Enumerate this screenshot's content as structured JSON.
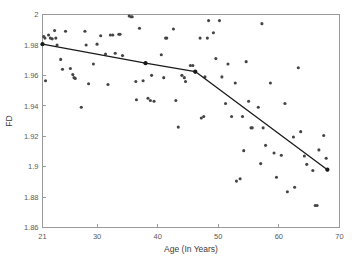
{
  "chart_data": {
    "type": "scatter",
    "title": "",
    "xlabel": "Age (In Years)",
    "ylabel": "FD",
    "xlim": [
      21,
      70
    ],
    "ylim": [
      1.86,
      2.0
    ],
    "grid": false,
    "legend": null,
    "xticks": [
      21,
      30,
      40,
      50,
      60,
      70
    ],
    "xticklabels": [
      "21",
      "30",
      "40",
      "50",
      "60",
      "70"
    ],
    "yticks": [
      1.86,
      1.88,
      1.9,
      1.92,
      1.94,
      1.96,
      1.98,
      2
    ],
    "yticklabels": [
      "1.86",
      "1.88",
      "1.9",
      "1.92",
      "1.94",
      "1.96",
      "1.98",
      "2"
    ],
    "series": [
      {
        "name": "FD measurements",
        "type": "scatter",
        "marker": "dot",
        "color": "#444444",
        "points": [
          [
            21.2,
            1.9855
          ],
          [
            21.4,
            1.9845
          ],
          [
            21.5,
            1.9565
          ],
          [
            22.0,
            1.9865
          ],
          [
            22.3,
            1.9845
          ],
          [
            22.6,
            1.984
          ],
          [
            23.0,
            1.9895
          ],
          [
            23.2,
            1.9845
          ],
          [
            23.4,
            1.98
          ],
          [
            24.0,
            1.9705
          ],
          [
            24.3,
            1.964
          ],
          [
            24.8,
            1.989
          ],
          [
            25.6,
            1.9645
          ],
          [
            26.0,
            1.9605
          ],
          [
            26.2,
            1.9585
          ],
          [
            26.4,
            1.958
          ],
          [
            27.4,
            1.939
          ],
          [
            28.0,
            1.989
          ],
          [
            28.2,
            1.98
          ],
          [
            28.6,
            1.9545
          ],
          [
            29.4,
            1.9675
          ],
          [
            30.0,
            1.9805
          ],
          [
            30.6,
            1.986
          ],
          [
            31.4,
            1.974
          ],
          [
            31.8,
            1.954
          ],
          [
            32.2,
            1.9865
          ],
          [
            32.6,
            1.9865
          ],
          [
            33.0,
            1.9745
          ],
          [
            33.6,
            1.987
          ],
          [
            33.8,
            1.987
          ],
          [
            34.2,
            1.973
          ],
          [
            35.3,
            1.999
          ],
          [
            35.6,
            1.9985
          ],
          [
            35.8,
            1.9985
          ],
          [
            36.4,
            1.956
          ],
          [
            36.5,
            1.944
          ],
          [
            37.0,
            1.991
          ],
          [
            37.6,
            1.9565
          ],
          [
            38.0,
            1.968
          ],
          [
            38.4,
            1.945
          ],
          [
            38.8,
            1.9435
          ],
          [
            39.0,
            1.96
          ],
          [
            39.4,
            1.943
          ],
          [
            40.6,
            1.9735
          ],
          [
            41.0,
            1.9585
          ],
          [
            41.3,
            1.9845
          ],
          [
            41.5,
            1.9845
          ],
          [
            42.6,
            1.9905
          ],
          [
            43.0,
            1.9435
          ],
          [
            43.4,
            1.926
          ],
          [
            44.0,
            1.96
          ],
          [
            44.4,
            1.9585
          ],
          [
            44.6,
            1.956
          ],
          [
            45.4,
            1.9665
          ],
          [
            45.8,
            1.9665
          ],
          [
            46.2,
            1.962
          ],
          [
            47.0,
            1.9845
          ],
          [
            47.2,
            1.932
          ],
          [
            47.6,
            1.933
          ],
          [
            47.8,
            1.959
          ],
          [
            48.2,
            1.9845
          ],
          [
            48.4,
            1.996
          ],
          [
            49.6,
            1.971
          ],
          [
            50.2,
            1.996
          ],
          [
            50.6,
            1.959
          ],
          [
            51.2,
            1.9415
          ],
          [
            51.6,
            1.9675
          ],
          [
            52.2,
            1.933
          ],
          [
            52.8,
            1.955
          ],
          [
            53.0,
            1.8905
          ],
          [
            53.6,
            1.892
          ],
          [
            54.2,
            1.9105
          ],
          [
            54.6,
            1.969
          ],
          [
            55.0,
            1.943
          ],
          [
            55.4,
            1.9255
          ],
          [
            55.6,
            1.9255
          ],
          [
            56.6,
            1.939
          ],
          [
            57.0,
            1.902
          ],
          [
            57.2,
            1.994
          ],
          [
            57.8,
            1.914
          ],
          [
            58.6,
            1.955
          ],
          [
            59.2,
            1.909
          ],
          [
            59.6,
            1.893
          ],
          [
            60.4,
            1.9075
          ],
          [
            61.0,
            1.9415
          ],
          [
            61.4,
            1.8835
          ],
          [
            62.4,
            1.9195
          ],
          [
            62.6,
            1.8865
          ],
          [
            63.2,
            1.965
          ],
          [
            63.6,
            1.923
          ],
          [
            64.2,
            1.907
          ],
          [
            64.6,
            1.9015
          ],
          [
            65.6,
            1.8975
          ],
          [
            66.0,
            1.8745
          ],
          [
            66.3,
            1.8745
          ],
          [
            66.6,
            1.911
          ],
          [
            67.4,
            1.9205
          ],
          [
            67.8,
            1.9055
          ],
          [
            68.0,
            1.898
          ],
          [
            49.2,
            1.988
          ],
          [
            57.4,
            1.9255
          ],
          [
            54.0,
            1.933
          ]
        ]
      },
      {
        "name": "Piecewise fit",
        "type": "line",
        "color": "#1a1a1a",
        "vertices": [
          [
            21.0,
            1.9805
          ],
          [
            38.0,
            1.968
          ],
          [
            46.2,
            1.9625
          ],
          [
            68.0,
            1.898
          ]
        ]
      }
    ]
  }
}
